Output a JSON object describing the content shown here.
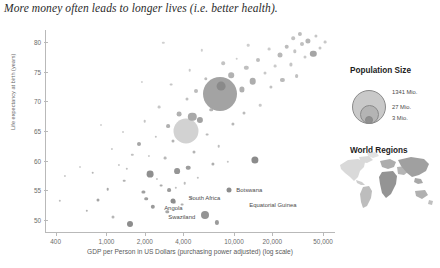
{
  "chart_data": {
    "type": "scatter",
    "title": "More money often leads to longer lives (i.e. better health).",
    "xlabel": "GDP per Person in US Dollars (purchasing power adjusted) (log scale)",
    "ylabel": "Life expectancy at birth (years)",
    "xscale": "log",
    "xlim": [
      330,
      62000
    ],
    "ylim": [
      48,
      82
    ],
    "xticks": [
      "400",
      "1,000",
      "2,000",
      "4,000",
      "10,000",
      "20,000",
      "50,000"
    ],
    "xtick_values": [
      400,
      1000,
      2000,
      4000,
      10000,
      20000,
      50000
    ],
    "yticks": [
      "50",
      "55",
      "60",
      "65",
      "70",
      "75",
      "80"
    ],
    "ytick_values": [
      50,
      55,
      60,
      65,
      70,
      75,
      80
    ],
    "grid": false,
    "size_encoding": "population",
    "color_encoding": "world region",
    "points": [
      {
        "x": 1540,
        "y": 49.4,
        "r": 3.0,
        "c": "#8d8d8d"
      },
      {
        "x": 7400,
        "y": 49.6,
        "r": 2.1,
        "c": "#9b9b9b"
      },
      {
        "x": 1130,
        "y": 50.6,
        "r": 1.5,
        "c": "#b6b6b6"
      },
      {
        "x": 5900,
        "y": 50.8,
        "r": 4.0,
        "c": "#949494"
      },
      {
        "x": 3000,
        "y": 51.4,
        "r": 1.7,
        "c": "#a8a8a8"
      },
      {
        "x": 2300,
        "y": 52.2,
        "r": 2.2,
        "c": "#9a9a9a"
      },
      {
        "x": 3900,
        "y": 52.6,
        "r": 1.4,
        "c": "#b0b0b0"
      },
      {
        "x": 3400,
        "y": 53.0,
        "r": 1.2,
        "c": "#c2c2c2"
      },
      {
        "x": 860,
        "y": 53.4,
        "r": 1.5,
        "c": "#a4a4a4"
      },
      {
        "x": 2050,
        "y": 53.6,
        "r": 1.8,
        "c": "#9e9e9e"
      },
      {
        "x": 4600,
        "y": 53.8,
        "r": 1.3,
        "c": "#bcbcbc"
      },
      {
        "x": 1950,
        "y": 54.8,
        "r": 1.6,
        "c": "#a0a0a0"
      },
      {
        "x": 3100,
        "y": 55.0,
        "r": 1.9,
        "c": "#9c9c9c"
      },
      {
        "x": 3500,
        "y": 55.4,
        "r": 1.2,
        "c": "#bfbfbf"
      },
      {
        "x": 2700,
        "y": 55.8,
        "r": 1.4,
        "c": "#ababab"
      },
      {
        "x": 4100,
        "y": 56.2,
        "r": 1.3,
        "c": "#bdbdbd"
      },
      {
        "x": 1380,
        "y": 56.6,
        "r": 1.3,
        "c": "#b2b2b2"
      },
      {
        "x": 2500,
        "y": 56.9,
        "r": 1.1,
        "c": "#c6c6c6"
      },
      {
        "x": 5200,
        "y": 57.1,
        "r": 1.2,
        "c": "#c0c0c0"
      },
      {
        "x": 2200,
        "y": 57.8,
        "r": 3.4,
        "c": "#8f8f8f"
      },
      {
        "x": 3600,
        "y": 58.3,
        "r": 2.9,
        "c": "#959595"
      },
      {
        "x": 4400,
        "y": 58.8,
        "r": 2.3,
        "c": "#9d9d9d"
      },
      {
        "x": 780,
        "y": 58.0,
        "r": 1.3,
        "c": "#b5b5b5"
      },
      {
        "x": 1250,
        "y": 59.3,
        "r": 1.1,
        "c": "#c8c8c8"
      },
      {
        "x": 6800,
        "y": 59.4,
        "r": 1.6,
        "c": "#aeaeae"
      },
      {
        "x": 9000,
        "y": 59.8,
        "r": 1.2,
        "c": "#c4c4c4"
      },
      {
        "x": 2900,
        "y": 60.4,
        "r": 1.4,
        "c": "#b8b8b8"
      },
      {
        "x": 14500,
        "y": 60.2,
        "r": 3.6,
        "c": "#8b8b8b"
      },
      {
        "x": 1600,
        "y": 61.0,
        "r": 1.2,
        "c": "#c1c1c1"
      },
      {
        "x": 4900,
        "y": 61.4,
        "r": 1.5,
        "c": "#b4b4b4"
      },
      {
        "x": 1100,
        "y": 62.0,
        "r": 1.1,
        "c": "#cacaca"
      },
      {
        "x": 7600,
        "y": 62.4,
        "r": 1.3,
        "c": "#bebebe"
      },
      {
        "x": 1800,
        "y": 62.8,
        "r": 2.0,
        "c": "#a6a6a6"
      },
      {
        "x": 3300,
        "y": 63.4,
        "r": 1.5,
        "c": "#b3b3b3"
      },
      {
        "x": 2450,
        "y": 64.0,
        "r": 1.2,
        "c": "#c3c3c3"
      },
      {
        "x": 6200,
        "y": 64.4,
        "r": 1.4,
        "c": "#bababa"
      },
      {
        "x": 1350,
        "y": 64.9,
        "r": 1.0,
        "c": "#cccccc"
      },
      {
        "x": 4200,
        "y": 65.0,
        "r": 12.5,
        "c": "#d2d2d2"
      },
      {
        "x": 3050,
        "y": 65.8,
        "r": 1.9,
        "c": "#b0b0b0"
      },
      {
        "x": 9800,
        "y": 66.2,
        "r": 1.6,
        "c": "#b7b7b7"
      },
      {
        "x": 2000,
        "y": 66.6,
        "r": 1.3,
        "c": "#c5c5c5"
      },
      {
        "x": 5400,
        "y": 66.9,
        "r": 3.1,
        "c": "#a2a2a2"
      },
      {
        "x": 4700,
        "y": 67.4,
        "r": 4.2,
        "c": "#a9a9a9"
      },
      {
        "x": 3700,
        "y": 67.9,
        "r": 2.4,
        "c": "#b1b1b1"
      },
      {
        "x": 12000,
        "y": 68.0,
        "r": 1.5,
        "c": "#bbbbbb"
      },
      {
        "x": 6600,
        "y": 68.6,
        "r": 1.8,
        "c": "#b4b4b4"
      },
      {
        "x": 2600,
        "y": 69.0,
        "r": 1.4,
        "c": "#c7c7c7"
      },
      {
        "x": 16000,
        "y": 69.3,
        "r": 1.3,
        "c": "#c9c9c9"
      },
      {
        "x": 8600,
        "y": 70.0,
        "r": 1.7,
        "c": "#b9b9b9"
      },
      {
        "x": 4300,
        "y": 70.4,
        "r": 1.5,
        "c": "#c0c0c0"
      },
      {
        "x": 7800,
        "y": 71.2,
        "r": 17.0,
        "c": "#a3a3a3"
      },
      {
        "x": 7900,
        "y": 72.6,
        "r": 4.4,
        "c": "#8a8a8a"
      },
      {
        "x": 5000,
        "y": 71.8,
        "r": 2.0,
        "c": "#bcbcbc"
      },
      {
        "x": 11500,
        "y": 72.0,
        "r": 2.6,
        "c": "#b0b0b0"
      },
      {
        "x": 19500,
        "y": 72.4,
        "r": 1.6,
        "c": "#c2c2c2"
      },
      {
        "x": 3200,
        "y": 72.8,
        "r": 1.4,
        "c": "#c6c6c6"
      },
      {
        "x": 14000,
        "y": 73.4,
        "r": 3.3,
        "c": "#adadad"
      },
      {
        "x": 6000,
        "y": 73.8,
        "r": 1.7,
        "c": "#bdbdbd"
      },
      {
        "x": 24000,
        "y": 73.6,
        "r": 2.1,
        "c": "#bababa"
      },
      {
        "x": 9500,
        "y": 74.4,
        "r": 2.8,
        "c": "#b2b2b2"
      },
      {
        "x": 17500,
        "y": 74.8,
        "r": 1.5,
        "c": "#c8c8c8"
      },
      {
        "x": 31000,
        "y": 74.2,
        "r": 1.9,
        "c": "#c1c1c1"
      },
      {
        "x": 4500,
        "y": 75.2,
        "r": 1.3,
        "c": "#cbcbcb"
      },
      {
        "x": 12500,
        "y": 75.6,
        "r": 2.2,
        "c": "#bfbfbf"
      },
      {
        "x": 21000,
        "y": 75.9,
        "r": 1.4,
        "c": "#cacaca"
      },
      {
        "x": 8200,
        "y": 76.4,
        "r": 1.8,
        "c": "#c3c3c3"
      },
      {
        "x": 28000,
        "y": 76.2,
        "r": 1.6,
        "c": "#c5c5c5"
      },
      {
        "x": 15500,
        "y": 77.0,
        "r": 2.0,
        "c": "#bebebe"
      },
      {
        "x": 36000,
        "y": 77.4,
        "r": 1.5,
        "c": "#c9c9c9"
      },
      {
        "x": 23000,
        "y": 77.8,
        "r": 2.5,
        "c": "#b8b8b8"
      },
      {
        "x": 10500,
        "y": 77.2,
        "r": 1.3,
        "c": "#cccccc"
      },
      {
        "x": 30000,
        "y": 78.4,
        "r": 1.7,
        "c": "#c4c4c4"
      },
      {
        "x": 42000,
        "y": 78.0,
        "r": 3.2,
        "c": "#a5a5a5"
      },
      {
        "x": 19000,
        "y": 78.8,
        "r": 1.4,
        "c": "#cbcbcb"
      },
      {
        "x": 26000,
        "y": 79.2,
        "r": 2.3,
        "c": "#bcbcbc"
      },
      {
        "x": 34000,
        "y": 79.6,
        "r": 2.0,
        "c": "#c0c0c0"
      },
      {
        "x": 47000,
        "y": 79.0,
        "r": 1.5,
        "c": "#c7c7c7"
      },
      {
        "x": 38000,
        "y": 80.2,
        "r": 2.6,
        "c": "#b6b6b6"
      },
      {
        "x": 29000,
        "y": 80.6,
        "r": 1.8,
        "c": "#c2c2c2"
      },
      {
        "x": 44000,
        "y": 81.0,
        "r": 1.6,
        "c": "#c6c6c6"
      },
      {
        "x": 33000,
        "y": 81.3,
        "r": 2.1,
        "c": "#bdbdbd"
      },
      {
        "x": 13000,
        "y": 79.4,
        "r": 1.3,
        "c": "#cecece"
      },
      {
        "x": 52000,
        "y": 80.0,
        "r": 1.4,
        "c": "#c8c8c8"
      },
      {
        "x": 2800,
        "y": 79.8,
        "r": 1.2,
        "c": "#d0d0d0"
      },
      {
        "x": 5600,
        "y": 78.6,
        "r": 1.2,
        "c": "#cfcfcf"
      },
      {
        "x": 1900,
        "y": 73.2,
        "r": 1.1,
        "c": "#d1d1d1"
      },
      {
        "x": 900,
        "y": 66.0,
        "r": 1.0,
        "c": "#d2d2d2"
      },
      {
        "x": 620,
        "y": 59.0,
        "r": 1.0,
        "c": "#d0d0d0"
      },
      {
        "x": 430,
        "y": 53.2,
        "r": 1.2,
        "c": "#bdbdbd"
      },
      {
        "x": 470,
        "y": 57.4,
        "r": 1.1,
        "c": "#c9c9c9"
      },
      {
        "x": 700,
        "y": 51.6,
        "r": 1.2,
        "c": "#b1b1b1"
      },
      {
        "x": 1020,
        "y": 55.2,
        "r": 1.3,
        "c": "#a9a9a9"
      },
      {
        "x": 1450,
        "y": 58.6,
        "r": 1.2,
        "c": "#bfbfbf"
      },
      {
        "x": 2150,
        "y": 60.8,
        "r": 1.1,
        "c": "#cacaca"
      }
    ],
    "annotations": [
      {
        "label": "Botswana",
        "x": 9200,
        "y": 55.0,
        "dot": true,
        "dx": 7,
        "dy": 0,
        "align": "left"
      },
      {
        "label": "South Africa",
        "x": 9200,
        "y": 53.8,
        "dot": false,
        "dx": -9,
        "dy": 0,
        "align": "right"
      },
      {
        "label": "Equatorial Guinea",
        "x": 12500,
        "y": 52.6,
        "dot": false,
        "dx": 3,
        "dy": 0,
        "align": "left"
      },
      {
        "label": "Angola",
        "x": 3350,
        "y": 53.3,
        "dot": true,
        "dx": 0,
        "dy": 7,
        "align": "center"
      },
      {
        "label": "Swaziland",
        "x": 3900,
        "y": 50.5,
        "dot": false,
        "dx": 0,
        "dy": 0,
        "align": "center"
      }
    ]
  },
  "legends": {
    "population": {
      "title": "Population Size",
      "sizes": [
        "3 Mio.",
        "27 Mio.",
        "1341 Mio."
      ]
    },
    "regions": {
      "title": "World Regions"
    }
  }
}
